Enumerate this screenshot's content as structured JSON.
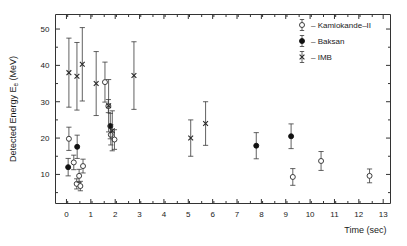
{
  "chart_data": {
    "type": "scatter",
    "title": "",
    "xlabel": "Time  (sec)",
    "ylabel_main": "Detected Energy  E",
    "ylabel_sub": "e",
    "ylabel_unit": "  (MeV)",
    "xlim": [
      -0.45,
      13.3
    ],
    "ylim": [
      2.0,
      54.0
    ],
    "xticks": [
      0,
      1,
      2,
      3,
      4,
      5,
      6,
      7,
      8,
      9,
      10,
      11,
      12,
      13
    ],
    "xticklabels": [
      "0",
      "1",
      "2",
      "3",
      "4",
      "5",
      "6",
      "7",
      "8",
      "9",
      "10",
      "11",
      "12",
      "13"
    ],
    "yticks": [
      10,
      20,
      30,
      40,
      50
    ],
    "yticklabels": [
      "10",
      "20",
      "30",
      "40",
      "50"
    ],
    "grid": false,
    "legend_position": "top-right",
    "series": [
      {
        "name": "Kamiokande-II",
        "marker": "open-circle",
        "color": "#ffffff",
        "edge_color": "#2a2a2a",
        "points": [
          {
            "x": 0.1,
            "y": 19.8,
            "yerr_lo": 3.2,
            "yerr_hi": 3.2
          },
          {
            "x": 0.3,
            "y": 13.3,
            "yerr_lo": 2.0,
            "yerr_hi": 2.0
          },
          {
            "x": 0.42,
            "y": 7.4,
            "yerr_lo": 1.4,
            "yerr_hi": 1.4
          },
          {
            "x": 0.52,
            "y": 9.6,
            "yerr_lo": 1.8,
            "yerr_hi": 1.8
          },
          {
            "x": 0.57,
            "y": 6.8,
            "yerr_lo": 1.3,
            "yerr_hi": 1.3
          },
          {
            "x": 0.68,
            "y": 12.3,
            "yerr_lo": 1.9,
            "yerr_hi": 1.9
          },
          {
            "x": 1.58,
            "y": 35.4,
            "yerr_lo": 5.5,
            "yerr_hi": 5.5
          },
          {
            "x": 1.72,
            "y": 28.8,
            "yerr_lo": 1.8,
            "yerr_hi": 1.8
          },
          {
            "x": 1.82,
            "y": 20.9,
            "yerr_lo": 2.8,
            "yerr_hi": 2.8
          },
          {
            "x": 1.97,
            "y": 19.6,
            "yerr_lo": 2.7,
            "yerr_hi": 2.7
          },
          {
            "x": 9.29,
            "y": 9.3,
            "yerr_lo": 2.3,
            "yerr_hi": 2.3
          },
          {
            "x": 10.45,
            "y": 13.7,
            "yerr_lo": 2.6,
            "yerr_hi": 2.6
          },
          {
            "x": 12.44,
            "y": 9.6,
            "yerr_lo": 1.9,
            "yerr_hi": 1.9
          }
        ]
      },
      {
        "name": "Baksan",
        "marker": "filled-circle",
        "color": "#111111",
        "edge_color": "#111111",
        "points": [
          {
            "x": 0.07,
            "y": 12.0,
            "yerr_lo": 2.4,
            "yerr_hi": 2.4
          },
          {
            "x": 0.44,
            "y": 17.6,
            "yerr_lo": 3.2,
            "yerr_hi": 3.2
          },
          {
            "x": 1.8,
            "y": 23.3,
            "yerr_lo": 3.5,
            "yerr_hi": 3.5
          },
          {
            "x": 7.79,
            "y": 17.9,
            "yerr_lo": 3.6,
            "yerr_hi": 3.6
          },
          {
            "x": 9.22,
            "y": 20.5,
            "yerr_lo": 3.4,
            "yerr_hi": 3.4
          }
        ]
      },
      {
        "name": "IMB",
        "marker": "cross",
        "color": "#2a2a2a",
        "edge_color": "#2a2a2a",
        "points": [
          {
            "x": 0.1,
            "y": 38.0,
            "yerr_lo": 9.5,
            "yerr_hi": 9.5
          },
          {
            "x": 0.43,
            "y": 37.0,
            "yerr_lo": 9.3,
            "yerr_hi": 9.3
          },
          {
            "x": 0.65,
            "y": 40.3,
            "yerr_lo": 10.1,
            "yerr_hi": 10.1
          },
          {
            "x": 1.22,
            "y": 35.0,
            "yerr_lo": 8.8,
            "yerr_hi": 8.8
          },
          {
            "x": 1.73,
            "y": 28.9,
            "yerr_lo": 7.2,
            "yerr_hi": 7.2
          },
          {
            "x": 1.88,
            "y": 22.0,
            "yerr_lo": 5.5,
            "yerr_hi": 5.5
          },
          {
            "x": 2.77,
            "y": 37.2,
            "yerr_lo": 9.3,
            "yerr_hi": 9.3
          },
          {
            "x": 5.1,
            "y": 20.0,
            "yerr_lo": 5.0,
            "yerr_hi": 5.0
          },
          {
            "x": 5.71,
            "y": 24.0,
            "yerr_lo": 6.0,
            "yerr_hi": 6.0
          }
        ]
      }
    ]
  },
  "legend": {
    "entries": [
      {
        "dash": "–",
        "label": "Kamiokande–II"
      },
      {
        "dash": "–",
        "label": "Baksan"
      },
      {
        "dash": "–",
        "label": "IMB"
      }
    ]
  }
}
